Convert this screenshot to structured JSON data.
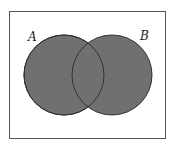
{
  "diagram": {
    "type": "venn",
    "shaded_region": "A union B",
    "sets": [
      {
        "label": "A",
        "cx": 64,
        "cy": 75,
        "r": 40
      },
      {
        "label": "B",
        "cx": 112,
        "cy": 75,
        "r": 40
      }
    ],
    "frame": {
      "x": 9.5,
      "y": 11.5,
      "width": 156,
      "height": 127
    },
    "colors": {
      "fill": "#707070",
      "stroke": "#303030",
      "frame": "#555555",
      "background": "#ffffff"
    }
  }
}
